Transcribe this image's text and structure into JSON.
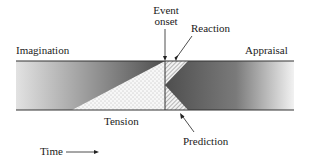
{
  "diagram": {
    "labels": {
      "event_onset_line1": "Event",
      "event_onset_line2": "onset",
      "reaction": "Reaction",
      "imagination": "Imagination",
      "appraisal": "Appraisal",
      "tension": "Tension",
      "prediction": "Prediction",
      "time": "Time"
    },
    "regions": [
      {
        "name": "imagination",
        "fill": "gradient light-to-dark (left of event onset)"
      },
      {
        "name": "tension",
        "fill": "dotted triangle rising toward event onset"
      },
      {
        "name": "reaction",
        "fill": "hatched triangle above, right of event onset"
      },
      {
        "name": "prediction",
        "fill": "hatched triangle below, right of event onset"
      },
      {
        "name": "appraisal",
        "fill": "gradient dark-to-light (right of event onset)"
      }
    ],
    "colors": {
      "dark": "#555555",
      "light": "#e6e6e6",
      "line": "#333333"
    }
  }
}
